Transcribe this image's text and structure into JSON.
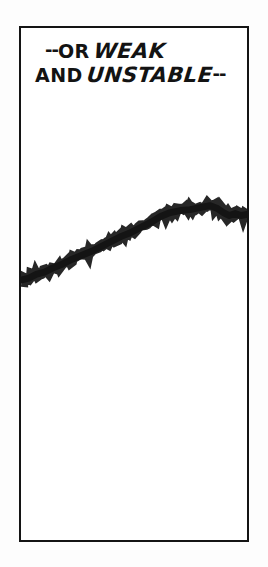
{
  "panel": {
    "border_color": "#141414",
    "background_color": "#ffffff",
    "page_background": "#fdfdfd"
  },
  "caption": {
    "line1": {
      "lead_dashes": "--",
      "plain": "OR",
      "emphasis": "WEAK"
    },
    "line2": {
      "plain": "AND",
      "emphasis": "UNSTABLE",
      "trail_dashes": "--"
    },
    "full_text": "--OR WEAK AND UNSTABLE--",
    "text_color": "#131313"
  },
  "chart_data": {
    "type": "line",
    "title": "",
    "subtitle": "",
    "xlabel": "",
    "ylabel": "",
    "grid": false,
    "legend": null,
    "style": "hand-drawn jagged ink stroke",
    "stroke_color": "#151515",
    "stroke_width": 7,
    "xlim": [
      0,
      230
    ],
    "ylim": [
      0,
      516
    ],
    "note": "Coordinates are panel-local pixels; y increases downward. Line rises left-to-right, peaks near x=195, dips, then rises again at the right edge.",
    "x": [
      0,
      8,
      16,
      24,
      32,
      42,
      52,
      62,
      72,
      82,
      92,
      102,
      112,
      122,
      132,
      142,
      152,
      162,
      172,
      182,
      192,
      200,
      206,
      212,
      218,
      224,
      230
    ],
    "y": [
      254,
      252,
      248,
      246,
      242,
      238,
      233,
      229,
      225,
      220,
      215,
      210,
      206,
      201,
      196,
      190,
      186,
      184,
      183,
      181,
      179,
      182,
      186,
      189,
      187,
      189,
      188
    ],
    "series": [
      {
        "name": "trend",
        "values": [
          254,
          252,
          248,
          246,
          242,
          238,
          233,
          229,
          225,
          220,
          215,
          210,
          206,
          201,
          196,
          190,
          186,
          184,
          183,
          181,
          179,
          182,
          186,
          189,
          187,
          189,
          188
        ]
      }
    ]
  }
}
